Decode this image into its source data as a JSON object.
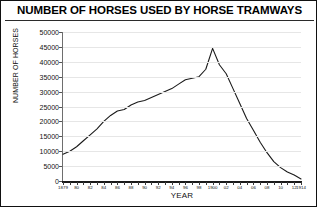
{
  "chart_data": {
    "type": "line",
    "title": "NUMBER OF HORSES USED BY HORSE TRAMWAYS",
    "xlabel": "YEAR",
    "ylabel": "NUMBER OF HORSES",
    "grid": true,
    "legend": "none",
    "ylim": [
      0,
      50000
    ],
    "yticks": [
      0,
      5000,
      10000,
      15000,
      20000,
      25000,
      30000,
      35000,
      40000,
      45000,
      50000
    ],
    "ytick_labels": [
      "0",
      "5000",
      "10000",
      "15000",
      "20000",
      "25000",
      "30000",
      "35000",
      "40000",
      "45000",
      "50000"
    ],
    "xlim": [
      1879,
      1914
    ],
    "xticks": [
      1879,
      1880,
      1881,
      1882,
      1883,
      1884,
      1885,
      1886,
      1887,
      1888,
      1889,
      1890,
      1891,
      1892,
      1893,
      1894,
      1895,
      1896,
      1897,
      1898,
      1899,
      1900,
      1901,
      1902,
      1903,
      1904,
      1905,
      1906,
      1907,
      1908,
      1909,
      1910,
      1911,
      1912,
      1913,
      1914
    ],
    "xtick_labels": [
      "1879",
      "",
      "80",
      "",
      "82",
      "",
      "84",
      "",
      "86",
      "",
      "88",
      "",
      "90",
      "",
      "92",
      "",
      "94",
      "",
      "96",
      "",
      "98",
      "",
      "1900",
      "",
      "02",
      "",
      "04",
      "",
      "06",
      "",
      "08",
      "",
      "10",
      "",
      "12",
      "1914"
    ],
    "xtick_labels_shown": [
      "1879",
      "80",
      "82",
      "84",
      "86",
      "88",
      "90",
      "92",
      "94",
      "96",
      "98",
      "1900",
      "02",
      "04",
      "06",
      "08",
      "10",
      "12",
      "1914"
    ],
    "series": [
      {
        "name": "Horses used by horse tramways",
        "color": "#1a1a1a",
        "x": [
          1879,
          1880,
          1881,
          1882,
          1883,
          1884,
          1885,
          1886,
          1887,
          1888,
          1889,
          1890,
          1891,
          1892,
          1893,
          1894,
          1895,
          1896,
          1897,
          1898,
          1899,
          1900,
          1901,
          1902,
          1903,
          1904,
          1905,
          1906,
          1907,
          1908,
          1909,
          1910,
          1911,
          1912,
          1913,
          1914
        ],
        "values": [
          9000,
          10000,
          11500,
          13500,
          15500,
          17500,
          20000,
          22000,
          23500,
          24000,
          25500,
          26500,
          27000,
          28000,
          29000,
          30000,
          31000,
          32500,
          34000,
          34500,
          35000,
          37500,
          44500,
          39000,
          36000,
          31000,
          26000,
          21000,
          17000,
          13000,
          9500,
          6500,
          4500,
          3000,
          2000,
          700
        ]
      }
    ]
  }
}
